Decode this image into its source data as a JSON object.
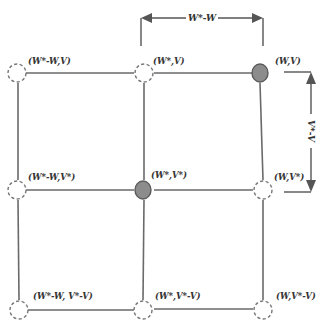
{
  "diagram": {
    "type": "grid-neighborhood",
    "colors": {
      "edge": "#6a6a6a",
      "filled_node": "#8c8c8c",
      "empty_node_stroke": "#777777",
      "text": "#333333"
    },
    "nodes": [
      {
        "id": "n-top-left",
        "label": "(W*-W,V)",
        "row": 0,
        "col": 0,
        "filled": false
      },
      {
        "id": "n-top-mid",
        "label": "(W*,V)",
        "row": 0,
        "col": 1,
        "filled": false
      },
      {
        "id": "n-top-right",
        "label": "(W,V)",
        "row": 0,
        "col": 2,
        "filled": true
      },
      {
        "id": "n-mid-left",
        "label": "(W*-W,V*)",
        "row": 1,
        "col": 0,
        "filled": false
      },
      {
        "id": "n-mid-mid",
        "label": "(W*,V*)",
        "row": 1,
        "col": 1,
        "filled": true
      },
      {
        "id": "n-mid-right",
        "label": "(W,V*)",
        "row": 1,
        "col": 2,
        "filled": false
      },
      {
        "id": "n-bot-left",
        "label": "(W*-W, V*-V)",
        "row": 2,
        "col": 0,
        "filled": false
      },
      {
        "id": "n-bot-mid",
        "label": "(W*,V*-V)",
        "row": 2,
        "col": 1,
        "filled": false
      },
      {
        "id": "n-bot-right",
        "label": "(W,V*-V)",
        "row": 2,
        "col": 2,
        "filled": false
      }
    ],
    "dimensions": {
      "horizontal": {
        "label": "W*-W"
      },
      "vertical": {
        "label": "V*-V"
      }
    }
  }
}
